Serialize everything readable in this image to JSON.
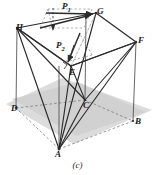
{
  "figure": {
    "caption": "(c)",
    "type": "3d-geometry-diagram",
    "colors": {
      "line": "#2b2b2b",
      "hidden_line": "#8a8a8a",
      "ground_fill": "#cfcfcf",
      "background": "#ffffff"
    },
    "vertices": [
      {
        "id": "A",
        "label": "A",
        "x": 59,
        "y": 149
      },
      {
        "id": "B",
        "label": "B",
        "x": 133,
        "y": 121
      },
      {
        "id": "C",
        "label": "C",
        "x": 85,
        "y": 100
      },
      {
        "id": "D",
        "label": "D",
        "x": 16,
        "y": 108
      },
      {
        "id": "E",
        "label": "E",
        "x": 71,
        "y": 66
      },
      {
        "id": "F",
        "label": "F",
        "x": 136,
        "y": 42
      },
      {
        "id": "G",
        "label": "G",
        "x": 96,
        "y": 13
      },
      {
        "id": "H",
        "label": "H",
        "x": 17,
        "y": 28
      }
    ],
    "forces": [
      {
        "id": "P1",
        "label": "P",
        "sub": "1",
        "x": 62,
        "y": 2
      },
      {
        "id": "P2",
        "label": "P",
        "sub": "2",
        "x": 56,
        "y": 41
      }
    ]
  }
}
